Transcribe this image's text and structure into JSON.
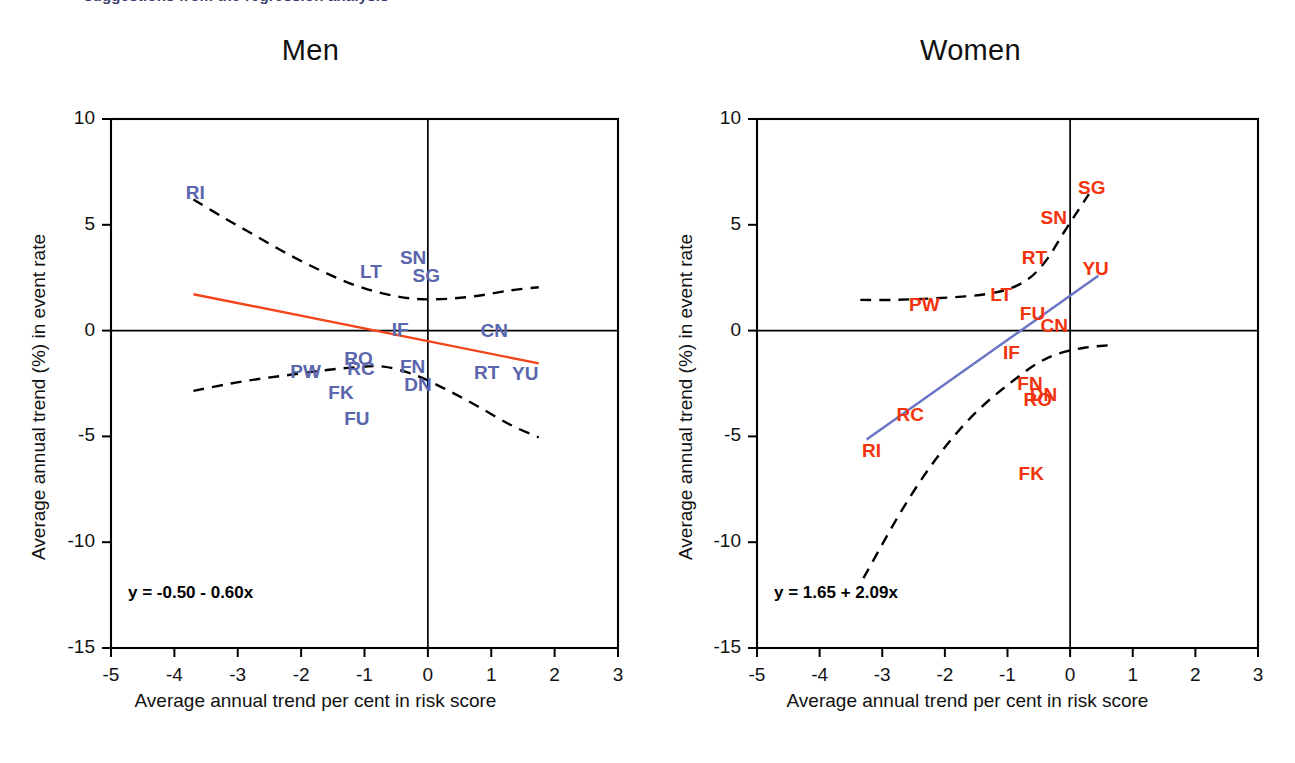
{
  "figure": {
    "cut_off_title": "suggestions from the regression analysis",
    "background": "#ffffff"
  },
  "axes": {
    "xlabel": "Average annual trend per cent in risk score",
    "ylabel": "Average annual trend (%) in event rate",
    "x_ticks": [
      "-5",
      "-4",
      "-3",
      "-2",
      "-1",
      "0",
      "1",
      "2",
      "3"
    ],
    "y_ticks": [
      "10",
      "5",
      "0",
      "-5",
      "-10",
      "-15"
    ],
    "xlim": [
      -5,
      3
    ],
    "ylim": [
      -15,
      10
    ]
  },
  "colors": {
    "men_label": "#5a66ad",
    "women_label": "#f3330d",
    "men_fit_line": "#f4451d",
    "women_fit_line": "#6b74c4",
    "band": "#000000",
    "axis": "#000000"
  },
  "chart_data": [
    {
      "type": "scatter",
      "title": "Men",
      "xlabel": "Average annual trend per cent in risk score",
      "ylabel": "Average annual trend (%) in event rate",
      "xlim": [
        -5,
        3
      ],
      "ylim": [
        -15,
        10
      ],
      "grid": false,
      "legend": "none",
      "label_color": "#5a66ad",
      "fit_color": "#f4451d",
      "equation": "y = -0.50 - 0.60x",
      "fit": {
        "intercept": -0.5,
        "slope": -0.6,
        "x_from": -3.7,
        "x_to": 1.75
      },
      "points": [
        {
          "label": "RI",
          "x": -3.6,
          "y": 6.5
        },
        {
          "label": "SN",
          "x": -0.22,
          "y": 3.45
        },
        {
          "label": "LT",
          "x": -0.85,
          "y": 2.75
        },
        {
          "label": "SG",
          "x": -0.02,
          "y": 2.6
        },
        {
          "label": "IF",
          "x": -0.35,
          "y": 0.05
        },
        {
          "label": "CN",
          "x": 1.05,
          "y": 0.0
        },
        {
          "label": "RO",
          "x": -1.1,
          "y": -1.35
        },
        {
          "label": "RC",
          "x": -1.05,
          "y": -1.8
        },
        {
          "label": "PW",
          "x": -1.95,
          "y": -1.95
        },
        {
          "label": "FN",
          "x": -0.22,
          "y": -1.7
        },
        {
          "label": "RT",
          "x": 0.95,
          "y": -2.0
        },
        {
          "label": "YU",
          "x": 1.55,
          "y": -2.05
        },
        {
          "label": "DN",
          "x": -0.15,
          "y": -2.55
        },
        {
          "label": "FK",
          "x": -1.35,
          "y": -2.95
        },
        {
          "label": "FU",
          "x": -1.1,
          "y": -4.2
        }
      ],
      "upper_band": [
        [
          -3.7,
          6.2
        ],
        [
          -3.2,
          5.3
        ],
        [
          -2.7,
          4.45
        ],
        [
          -2.2,
          3.6
        ],
        [
          -1.7,
          2.85
        ],
        [
          -1.2,
          2.2
        ],
        [
          -0.7,
          1.75
        ],
        [
          -0.2,
          1.5
        ],
        [
          0.3,
          1.5
        ],
        [
          0.8,
          1.65
        ],
        [
          1.3,
          1.9
        ],
        [
          1.75,
          2.05
        ]
      ],
      "lower_band": [
        [
          -3.7,
          -2.85
        ],
        [
          -3.2,
          -2.55
        ],
        [
          -2.7,
          -2.3
        ],
        [
          -2.2,
          -2.1
        ],
        [
          -1.7,
          -1.9
        ],
        [
          -1.2,
          -1.75
        ],
        [
          -0.7,
          -1.7
        ],
        [
          -0.2,
          -2.1
        ],
        [
          0.3,
          -2.8
        ],
        [
          0.8,
          -3.6
        ],
        [
          1.3,
          -4.45
        ],
        [
          1.75,
          -5.05
        ]
      ]
    },
    {
      "type": "scatter",
      "title": "Women",
      "xlabel": "Average annual trend per cent in risk score",
      "ylabel": "Average annual trend (%) in event rate",
      "xlim": [
        -5,
        3
      ],
      "ylim": [
        -15,
        10
      ],
      "grid": false,
      "legend": "none",
      "label_color": "#f3330d",
      "fit_color": "#6b74c4",
      "equation": "y = 1.65 + 2.09x",
      "fit": {
        "intercept": 1.65,
        "slope": 2.09,
        "x_from": -3.25,
        "x_to": 0.45
      },
      "points": [
        {
          "label": "SG",
          "x": 0.35,
          "y": 6.75
        },
        {
          "label": "SN",
          "x": -0.25,
          "y": 5.3
        },
        {
          "label": "RT",
          "x": -0.55,
          "y": 3.45
        },
        {
          "label": "YU",
          "x": 0.42,
          "y": 2.9
        },
        {
          "label": "LT",
          "x": -1.05,
          "y": 1.7
        },
        {
          "label": "PW",
          "x": -2.35,
          "y": 1.2
        },
        {
          "label": "FU",
          "x": -0.58,
          "y": 0.8
        },
        {
          "label": "CN",
          "x": -0.25,
          "y": 0.2
        },
        {
          "label": "IF",
          "x": -0.85,
          "y": -1.05
        },
        {
          "label": "FN",
          "x": -0.62,
          "y": -2.5
        },
        {
          "label": "DN",
          "x": -0.42,
          "y": -3.05
        },
        {
          "label": "RO",
          "x": -0.52,
          "y": -3.3
        },
        {
          "label": "RC",
          "x": -2.55,
          "y": -4.0
        },
        {
          "label": "RI",
          "x": -3.1,
          "y": -5.7
        },
        {
          "label": "FK",
          "x": -0.6,
          "y": -6.8
        }
      ],
      "upper_band": [
        [
          -3.35,
          1.45
        ],
        [
          -2.85,
          1.45
        ],
        [
          -2.35,
          1.5
        ],
        [
          -1.85,
          1.58
        ],
        [
          -1.35,
          1.72
        ],
        [
          -0.95,
          2.0
        ],
        [
          -0.62,
          2.55
        ],
        [
          -0.35,
          3.45
        ],
        [
          -0.12,
          4.55
        ],
        [
          0.1,
          5.55
        ],
        [
          0.3,
          6.45
        ]
      ],
      "lower_band": [
        [
          -3.3,
          -11.7
        ],
        [
          -3.0,
          -10.1
        ],
        [
          -2.7,
          -8.55
        ],
        [
          -2.4,
          -7.15
        ],
        [
          -2.1,
          -5.9
        ],
        [
          -1.8,
          -4.8
        ],
        [
          -1.5,
          -3.85
        ],
        [
          -1.2,
          -3.05
        ],
        [
          -0.9,
          -2.35
        ],
        [
          -0.55,
          -1.6
        ],
        [
          -0.2,
          -1.1
        ],
        [
          0.25,
          -0.8
        ],
        [
          0.6,
          -0.7
        ]
      ]
    }
  ]
}
